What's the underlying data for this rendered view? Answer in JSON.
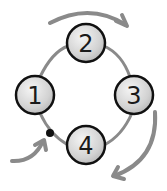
{
  "diagram": {
    "type": "cycle",
    "nodes": [
      {
        "id": "1",
        "label": "1",
        "cx": 35,
        "cy": 95
      },
      {
        "id": "2",
        "label": "2",
        "cx": 86,
        "cy": 43
      },
      {
        "id": "3",
        "label": "3",
        "cx": 134,
        "cy": 95
      },
      {
        "id": "4",
        "label": "4",
        "cx": 86,
        "cy": 145
      }
    ],
    "edges": [
      [
        "1",
        "2"
      ],
      [
        "2",
        "3"
      ],
      [
        "3",
        "4"
      ],
      [
        "4",
        "1"
      ]
    ],
    "entry_point": {
      "cx": 50,
      "cy": 133
    },
    "direction": "clockwise",
    "colors": {
      "node_fill": "#d9d9d9",
      "node_stroke": "#111111",
      "ring": "#8a8a8a",
      "arrow": "#8a8a8a",
      "dot": "#111111"
    }
  }
}
